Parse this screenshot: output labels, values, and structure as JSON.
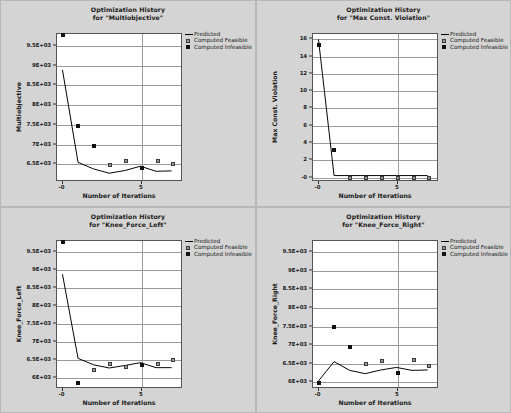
{
  "legend": {
    "position": "top-right",
    "entries": [
      {
        "label": "Predicted",
        "style": "line",
        "color": "#000000"
      },
      {
        "label": "Computed Feasible",
        "style": "square",
        "color": "#9a9a9a"
      },
      {
        "label": "Computed Infeasible",
        "style": "square",
        "color": "#111111"
      }
    ]
  },
  "common": {
    "xlabel": "Number of Iterations",
    "xticks": [
      "-0",
      "5"
    ],
    "xtick_values": [
      0,
      5
    ],
    "xlim": [
      -0.35,
      7.6
    ]
  },
  "chart_data": [
    {
      "id": "multiobjective",
      "type": "line",
      "title_line1": "Optimization History",
      "title_line2": "for \"Multiobjective\"",
      "xlabel": "Number of Iterations",
      "ylabel": "Multiobjective",
      "grid": true,
      "xlim": [
        -0.35,
        7.6
      ],
      "ylim": [
        6050,
        9800
      ],
      "yticks": [
        9500,
        9000,
        8500,
        8000,
        7500,
        7000,
        6500
      ],
      "ytick_labels": [
        "9.5E+03",
        "9E+03",
        "8.5E+03",
        "8E+03",
        "7.5E+03",
        "7E+03",
        "6.5E+03"
      ],
      "series": [
        {
          "name": "Predicted",
          "x": [
            0,
            1,
            2,
            3,
            4,
            5,
            6,
            7
          ],
          "values": [
            8880,
            6500,
            6330,
            6220,
            6290,
            6400,
            6270,
            6280
          ]
        },
        {
          "name": "Computed Feasible",
          "x": [
            3,
            4,
            6,
            7
          ],
          "values": [
            6490,
            6570,
            6580,
            6500
          ]
        },
        {
          "name": "Computed Infeasible",
          "x": [
            0,
            1,
            2,
            5
          ],
          "values": [
            9780,
            7480,
            6960,
            6400
          ]
        }
      ]
    },
    {
      "id": "max-const-violation",
      "type": "line",
      "title_line1": "Optimization History",
      "title_line2": "for \"Max Const. Violation\"",
      "xlabel": "Number of Iterations",
      "ylabel": "Max Const. Violation",
      "grid": true,
      "xlim": [
        -0.35,
        7.6
      ],
      "ylim": [
        -0.5,
        16.6
      ],
      "yticks": [
        16,
        14,
        12,
        10,
        8,
        6,
        4,
        2,
        0
      ],
      "ytick_labels": [
        "16",
        "14",
        "12",
        "10",
        "8",
        "6",
        "4",
        "2",
        "-0"
      ],
      "series": [
        {
          "name": "Predicted",
          "x": [
            0,
            1,
            2,
            3,
            4,
            5,
            6,
            7
          ],
          "values": [
            16.0,
            0.0,
            0.0,
            0.0,
            0.0,
            0.0,
            0.0,
            0.0
          ]
        },
        {
          "name": "Computed Feasible",
          "x": [
            2,
            3,
            4,
            5,
            6,
            7
          ],
          "values": [
            0.0,
            0.0,
            0.0,
            0.0,
            0.0,
            0.0
          ]
        },
        {
          "name": "Computed Infeasible",
          "x": [
            0,
            1
          ],
          "values": [
            15.3,
            3.2
          ]
        }
      ]
    },
    {
      "id": "knee-force-left",
      "type": "line",
      "title_line1": "Optimization History",
      "title_line2": "for \"Knee_Force_Left\"",
      "xlabel": "Number of Iterations",
      "ylabel": "Knee_Force_Left",
      "grid": true,
      "xlim": [
        -0.35,
        7.6
      ],
      "ylim": [
        5700,
        9800
      ],
      "yticks": [
        9500,
        9000,
        8500,
        8000,
        7500,
        7000,
        6500,
        6000
      ],
      "ytick_labels": [
        "9.5E+03",
        "9E+03",
        "8.5E+03",
        "8E+03",
        "7.5E+03",
        "7E+03",
        "6.5E+03",
        "6E+03"
      ],
      "series": [
        {
          "name": "Predicted",
          "x": [
            0,
            1,
            2,
            3,
            4,
            5,
            6,
            7
          ],
          "values": [
            8870,
            6500,
            6320,
            6230,
            6300,
            6380,
            6240,
            6240
          ]
        },
        {
          "name": "Computed Feasible",
          "x": [
            2,
            3,
            4,
            6,
            7
          ],
          "values": [
            6230,
            6400,
            6320,
            6400,
            6500
          ]
        },
        {
          "name": "Computed Infeasible",
          "x": [
            0,
            1,
            5
          ],
          "values": [
            9780,
            5870,
            6370
          ]
        }
      ]
    },
    {
      "id": "knee-force-right",
      "type": "line",
      "title_line1": "Optimization History",
      "title_line2": "for \"Knee_Force_Right\"",
      "xlabel": "Number of Iterations",
      "ylabel": "Knee_Force_Right",
      "grid": true,
      "xlim": [
        -0.35,
        7.6
      ],
      "ylim": [
        5820,
        9800
      ],
      "yticks": [
        9500,
        9000,
        8500,
        8000,
        7500,
        7000,
        6500,
        6000
      ],
      "ytick_labels": [
        "9.5E+03",
        "9E+03",
        "8.5E+03",
        "8E+03",
        "7.5E+03",
        "7E+03",
        "6.5E+03",
        "6E+03"
      ],
      "series": [
        {
          "name": "Predicted",
          "x": [
            0,
            1,
            2,
            3,
            4,
            5,
            6,
            7
          ],
          "values": [
            5980,
            6510,
            6270,
            6180,
            6280,
            6350,
            6270,
            6280
          ]
        },
        {
          "name": "Computed Feasible",
          "x": [
            3,
            4,
            6,
            7
          ],
          "values": [
            6480,
            6570,
            6590,
            6430
          ]
        },
        {
          "name": "Computed Infeasible",
          "x": [
            0,
            1,
            2,
            5
          ],
          "values": [
            5980,
            7480,
            6950,
            6250
          ]
        }
      ]
    }
  ]
}
